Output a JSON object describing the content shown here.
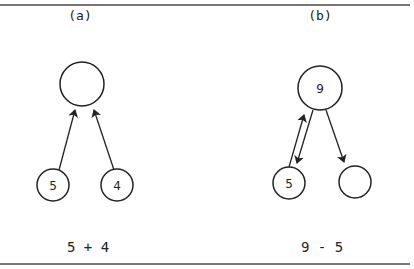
{
  "figure": {
    "rules": {
      "top_y": 5,
      "bottom_y": 264,
      "color": "#777777"
    },
    "panels": [
      {
        "id": "a",
        "label": "(a)",
        "caption": "5 + 4",
        "nodes": [
          {
            "id": "a-top",
            "text": "",
            "cx": 82,
            "cy": 84,
            "r": 22
          },
          {
            "id": "a-left",
            "text": "5",
            "cx": 53,
            "cy": 185,
            "r": 16
          },
          {
            "id": "a-right",
            "text": "4",
            "cx": 117,
            "cy": 185,
            "r": 16
          }
        ],
        "edges": [
          {
            "from": "a-left",
            "to": "a-top",
            "direction": "up"
          },
          {
            "from": "a-right",
            "to": "a-top",
            "direction": "up"
          }
        ]
      },
      {
        "id": "b",
        "label": "(b)",
        "caption": "9 - 5",
        "nodes": [
          {
            "id": "b-top",
            "text": "9",
            "cx": 320,
            "cy": 88,
            "r": 22
          },
          {
            "id": "b-left",
            "text": "5",
            "cx": 289,
            "cy": 183,
            "r": 16
          },
          {
            "id": "b-right",
            "text": "",
            "cx": 355,
            "cy": 182,
            "r": 16
          }
        ],
        "edges": [
          {
            "from": "b-left",
            "to": "b-top",
            "direction": "up"
          },
          {
            "from": "b-top",
            "to": "b-left",
            "direction": "down"
          },
          {
            "from": "b-top",
            "to": "b-right",
            "direction": "down"
          }
        ]
      }
    ]
  }
}
